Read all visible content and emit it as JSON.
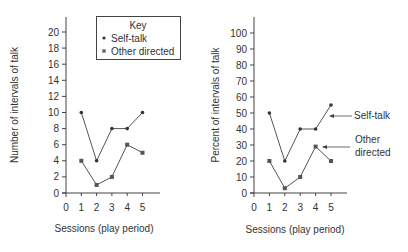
{
  "chart_data": [
    {
      "type": "line",
      "title": "",
      "xlabel": "Sessions (play period)",
      "ylabel": "Number of intervals of talk",
      "x": [
        1,
        2,
        3,
        4,
        5
      ],
      "x_ticks": [
        "0",
        "1",
        "2",
        "3",
        "4",
        "5"
      ],
      "y_ticks": [
        "0",
        "2",
        "4",
        "6",
        "8",
        "10",
        "12",
        "14",
        "16",
        "18",
        "20"
      ],
      "ylim": [
        0,
        20
      ],
      "xlim": [
        0,
        5
      ],
      "grid": false,
      "legend": {
        "title": "Key",
        "position": "upper right",
        "entries": [
          "Self-talk",
          "Other directed"
        ]
      },
      "series": [
        {
          "name": "Self-talk",
          "marker": "circle",
          "values": [
            10,
            4,
            8,
            8,
            10
          ]
        },
        {
          "name": "Other directed",
          "marker": "square",
          "values": [
            4,
            1,
            2,
            6,
            5
          ]
        }
      ]
    },
    {
      "type": "line",
      "title": "",
      "xlabel": "Sessions (play period)",
      "ylabel": "Percent of intervals of talk",
      "x": [
        1,
        2,
        3,
        4,
        5
      ],
      "x_ticks": [
        "0",
        "1",
        "2",
        "3",
        "4",
        "5"
      ],
      "y_ticks": [
        "0",
        "10",
        "20",
        "30",
        "40",
        "50",
        "60",
        "70",
        "80",
        "90",
        "100"
      ],
      "ylim": [
        0,
        100
      ],
      "xlim": [
        0,
        5
      ],
      "grid": false,
      "annotations": [
        {
          "text": "Self-talk",
          "points_to": "Self-talk series at session 5"
        },
        {
          "text": "Other directed",
          "points_to": "Other directed series at session 4"
        }
      ],
      "series": [
        {
          "name": "Self-talk",
          "marker": "circle",
          "values": [
            50,
            20,
            40,
            40,
            55
          ]
        },
        {
          "name": "Other directed",
          "marker": "square",
          "values": [
            20,
            3,
            10,
            29,
            20
          ]
        }
      ]
    }
  ],
  "left": {
    "ylabel": "Number of intervals of talk",
    "xlabel": "Sessions (play period)",
    "legend_title": "Key",
    "legend_self": "Self-talk",
    "legend_other": "Other directed"
  },
  "right": {
    "ylabel": "Percent of intervals of talk",
    "xlabel": "Sessions (play period)",
    "annot_self": "Self-talk",
    "annot_other_1": "Other",
    "annot_other_2": "directed"
  },
  "colors": {
    "line": "#555555",
    "axis": "#444444",
    "marker": "#444444"
  }
}
